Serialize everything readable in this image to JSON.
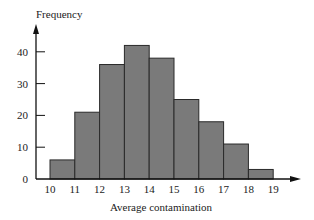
{
  "chart_data": {
    "type": "bar",
    "subtype": "histogram",
    "title": "",
    "xlabel": "Average contamination",
    "ylabel": "Frequency",
    "bin_edges": [
      10,
      11,
      12,
      13,
      14,
      15,
      16,
      17,
      18,
      19
    ],
    "categories": [
      "10-11",
      "11-12",
      "12-13",
      "13-14",
      "14-15",
      "15-16",
      "16-17",
      "17-18",
      "18-19"
    ],
    "values": [
      6,
      21,
      36,
      42,
      38,
      25,
      18,
      11,
      3
    ],
    "x_ticks": [
      "10",
      "11",
      "12",
      "13",
      "14",
      "15",
      "16",
      "17",
      "18",
      "19"
    ],
    "y_ticks": [
      "0",
      "10",
      "20",
      "30",
      "40"
    ],
    "ylim": [
      0,
      45
    ],
    "grid": false,
    "legend": null,
    "colors": {
      "bar_fill": "#7a7a7a",
      "bar_edge": "#2a2a2a",
      "axis": "#111111"
    }
  }
}
